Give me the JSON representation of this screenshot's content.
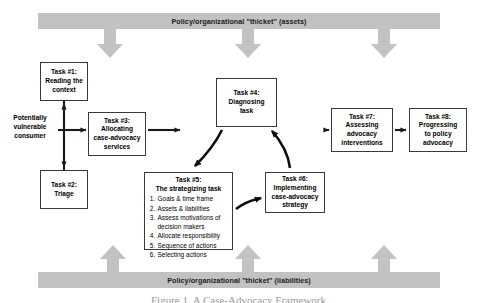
{
  "figure": {
    "width": 477,
    "height": 303,
    "background": "#ffffff",
    "band_color": "#c2c2c2",
    "box_border_color": "#3a3a3a",
    "arrow_color": "#1a1a1a",
    "caption": "Figure 1. A Case-Advocacy Framework"
  },
  "bands": {
    "top": {
      "label": "Policy/organizational \"thicket\" (assets)"
    },
    "bottom": {
      "label": "Policy/organizational \"thicket\" (liabilities)"
    }
  },
  "entry": {
    "line1": "Potentially",
    "line2": "vulnerable",
    "line3": "consumer"
  },
  "tasks": {
    "task1": {
      "line1": "Task #1:",
      "line2": "Reading the",
      "line3": "context"
    },
    "task2": {
      "line1": "Task #2:",
      "line2": "Triage"
    },
    "task3": {
      "line1": "Task #3:",
      "line2": "Allocating",
      "line3": "case-advocacy",
      "line4": "services"
    },
    "task4": {
      "line1": "Task #4:",
      "line2": "Diagnosing",
      "line3": "task"
    },
    "task5": {
      "line1": "Task #5:",
      "line2": "The strategizing task",
      "items": [
        "Goals & time frame",
        "Assets & liabilities",
        "Assess motivations of decision makers",
        "Allocate responsibility",
        "Sequence of actions",
        "Selecting actions"
      ]
    },
    "task6": {
      "line1": "Task #6:",
      "line2": "Implementing",
      "line3": "case-advocacy",
      "line4": "strategy"
    },
    "task7": {
      "line1": "Task #7:",
      "line2": "Assessing",
      "line3": "advocacy",
      "line4": "interventions"
    },
    "task8": {
      "line1": "Task #8:",
      "line2": "Progressing",
      "line3": "to policy",
      "line4": "advocacy"
    }
  }
}
